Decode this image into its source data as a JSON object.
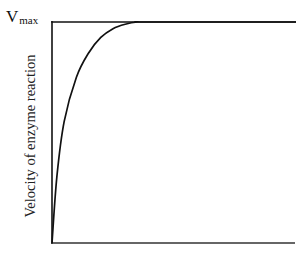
{
  "chart_data": {
    "type": "line",
    "title": "",
    "xlabel": "",
    "ylabel": "Velocity of enzyme reaction",
    "annotations": [
      {
        "text": "Vmax",
        "main": "V",
        "subscript": "max",
        "position": "top-left, aligned with horizontal asymptote line"
      }
    ],
    "axes": {
      "x_ticks": [],
      "y_ticks": [],
      "grid": false
    },
    "series": [
      {
        "name": "enzyme velocity (saturation curve)",
        "x": [
          0,
          0.02,
          0.05,
          0.1,
          0.15,
          0.2,
          0.25,
          0.3,
          0.35,
          0.4,
          1.0
        ],
        "y": [
          0,
          0.3,
          0.55,
          0.75,
          0.86,
          0.93,
          0.97,
          0.99,
          1.0,
          1.0,
          1.0
        ]
      },
      {
        "name": "Vmax asymptote",
        "x": [
          0,
          1.0
        ],
        "y": [
          1.0,
          1.0
        ]
      }
    ],
    "xlim": [
      0,
      1
    ],
    "ylim": [
      0,
      1
    ],
    "legend": "none"
  },
  "labels": {
    "vmax_main": "V",
    "vmax_sub": "max",
    "ylabel": "Velocity of enzyme reaction"
  },
  "colors": {
    "line": "#111111",
    "background": "#ffffff"
  }
}
